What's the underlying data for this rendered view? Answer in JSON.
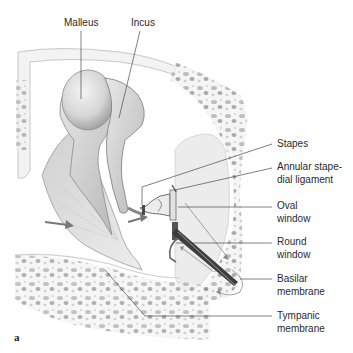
{
  "figure": {
    "letter": "a",
    "labels": {
      "malleus": "Malleus",
      "incus": "Incus",
      "stapes": "Stapes",
      "annular_line1": "Annular stape-",
      "annular_line2": "dial ligament",
      "oval_line1": "Oval",
      "oval_line2": "window",
      "round_line1": "Round",
      "round_line2": "window",
      "basilar_line1": "Basilar",
      "basilar_line2": "membrane",
      "tympanic_line1": "Tympanic",
      "tympanic_line2": "membrane"
    }
  }
}
